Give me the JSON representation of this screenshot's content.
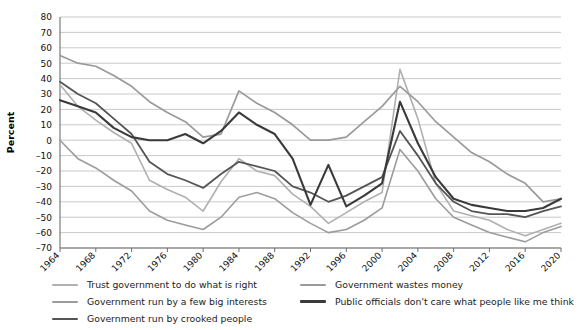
{
  "chart_data": {
    "type": "line",
    "title": "",
    "subtitle": "",
    "xlabel": "",
    "ylabel": "Percent",
    "xlim": [
      1964,
      2020
    ],
    "ylim": [
      -70,
      80
    ],
    "grid": true,
    "legend_position": "bottom",
    "x_ticks": [
      1964,
      1968,
      1972,
      1976,
      1980,
      1984,
      1988,
      1992,
      1996,
      2000,
      2004,
      2008,
      2012,
      2016,
      2020
    ],
    "y_ticks": [
      80,
      70,
      60,
      50,
      40,
      30,
      20,
      10,
      0,
      -10,
      -20,
      -30,
      -40,
      -50,
      -60,
      -70
    ],
    "x": [
      1964,
      1966,
      1968,
      1970,
      1972,
      1974,
      1976,
      1978,
      1980,
      1982,
      1984,
      1986,
      1988,
      1990,
      1992,
      1994,
      1996,
      1998,
      2000,
      2002,
      2004,
      2006,
      2008,
      2010,
      2012,
      2014,
      2016,
      2018,
      2020
    ],
    "series": [
      {
        "name": "Trust government to do what is right",
        "color": "#b0b0b0",
        "width": 1.6,
        "values": [
          36,
          22,
          13,
          5,
          -2,
          -26,
          -32,
          -37,
          -46,
          -27,
          -12,
          -20,
          -23,
          -35,
          -43,
          -54,
          -47,
          -40,
          -34,
          46,
          14,
          -28,
          -46,
          -49,
          -52,
          -58,
          -62,
          -58,
          -54
        ]
      },
      {
        "name": "Government run by a few big interests",
        "color": "#9c9c9c",
        "width": 1.6,
        "values": [
          0,
          -12,
          -18,
          -26,
          -33,
          -46,
          -52,
          -55,
          -58,
          -50,
          -37,
          -34,
          -38,
          -47,
          -54,
          -60,
          -58,
          -52,
          -44,
          -6,
          -20,
          -38,
          -50,
          -55,
          -60,
          -63,
          -66,
          -60,
          -56
        ]
      },
      {
        "name": "Government run by crooked people",
        "color": "#555555",
        "width": 1.8,
        "values": [
          38,
          30,
          24,
          14,
          4,
          -14,
          -22,
          -26,
          -31,
          -22,
          -14,
          -17,
          -20,
          -30,
          -34,
          -40,
          -36,
          -30,
          -24,
          6,
          -10,
          -28,
          -40,
          -46,
          -48,
          -48,
          -50,
          -46,
          -43
        ]
      },
      {
        "name": "Government wastes money",
        "color": "#9a9a9a",
        "width": 1.7,
        "values": [
          55,
          50,
          48,
          42,
          35,
          25,
          18,
          12,
          2,
          4,
          32,
          24,
          18,
          10,
          0,
          0,
          2,
          12,
          22,
          35,
          25,
          12,
          2,
          -8,
          -14,
          -22,
          -28,
          -40,
          -38
        ]
      },
      {
        "name": "Public officials don't care what people like me think",
        "color": "#3a3a3a",
        "width": 2.1,
        "values": [
          26,
          22,
          18,
          8,
          2,
          0,
          0,
          4,
          -2,
          6,
          18,
          10,
          4,
          -12,
          -42,
          -16,
          -43,
          -36,
          -28,
          25,
          -2,
          -24,
          -38,
          -42,
          -44,
          -46,
          -46,
          -44,
          -38
        ]
      }
    ]
  },
  "axis": {
    "y_label": "Percent"
  },
  "legend": {
    "left_column": [
      {
        "label": "Trust government to do what is right",
        "color": "#b0b0b0",
        "thickness": 2
      },
      {
        "label": "Government run by a few big interests",
        "color": "#9c9c9c",
        "thickness": 2
      },
      {
        "label": "Government run by crooked people",
        "color": "#555555",
        "thickness": 2.6
      }
    ],
    "right_column": [
      {
        "label": "Government wastes money",
        "color": "#9a9a9a",
        "thickness": 2
      },
      {
        "label": "Public officials don't care what people like me think",
        "color": "#3a3a3a",
        "thickness": 3
      }
    ]
  }
}
